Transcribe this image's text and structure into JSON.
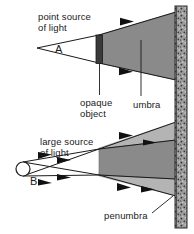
{
  "diagram": {
    "labels": {
      "point_source_line1": "point source",
      "point_source_line2": "of light",
      "source_a": "A",
      "opaque_line1": "opaque",
      "opaque_line2": "object",
      "umbra": "umbra",
      "large_source_line1": "large source",
      "large_source_line2": "of light",
      "source_b": "B",
      "penumbra": "penumbra"
    },
    "colors": {
      "background": "#ffffff",
      "stroke": "#1a1a1a",
      "umbra_fill": "#8a8a8a",
      "penumbra_fill": "#b4b4b4",
      "opaque_object_fill": "#3a3a3a",
      "wall_fill": "#9a9a9a",
      "wall_speckle": "#303030",
      "text": "#1a1a1a"
    },
    "geometry": {
      "wall_x": 175,
      "wall_width": 12,
      "point_source": {
        "x": 37,
        "y": 48
      },
      "large_source": {
        "cx": 23,
        "cy": 169,
        "rx": 7,
        "ry": 7
      },
      "opaque_object_top": {
        "x": 96,
        "y": 35,
        "w": 7,
        "h": 28
      },
      "opaque_object_bottom": {
        "x": 96,
        "y": 148,
        "w": 7,
        "h": 28
      }
    }
  }
}
